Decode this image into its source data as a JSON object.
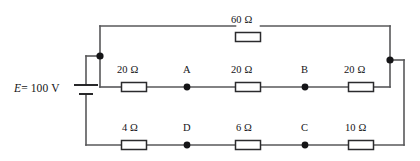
{
  "figure": {
    "kind": "circuit-diagram",
    "width": 420,
    "height": 161,
    "background_color": "#ffffff",
    "wire_color": "#58585a",
    "resistor_border_color": "#2b2b2d",
    "resistor_fill_color": "#ffffff",
    "node_dot_color": "#151517",
    "text_color": "#141416"
  },
  "source": {
    "label": "E = 100 V",
    "symbol_name": "battery-cell",
    "emf_symbol": "E",
    "equals": "=",
    "value": "100",
    "unit": "V"
  },
  "resistors": [
    {
      "id": "r-top-60",
      "label": "60 Ω",
      "value": 60,
      "unit": "Ω",
      "branch": "top",
      "cx": 248,
      "cy": 37,
      "label_x": 231,
      "label_y": 17
    },
    {
      "id": "r-mid-left-20",
      "label": "20 Ω",
      "value": 20,
      "unit": "Ω",
      "branch": "middle",
      "cx": 134,
      "cy": 87,
      "label_x": 117,
      "label_y": 67
    },
    {
      "id": "r-mid-center-20",
      "label": "20 Ω",
      "value": 20,
      "unit": "Ω",
      "branch": "middle",
      "cx": 248,
      "cy": 87,
      "label_x": 231,
      "label_y": 67
    },
    {
      "id": "r-mid-right-20",
      "label": "20 Ω",
      "value": 20,
      "unit": "Ω",
      "branch": "middle",
      "cx": 361,
      "cy": 87,
      "label_x": 344,
      "label_y": 67
    },
    {
      "id": "r-bot-left-4",
      "label": "4 Ω",
      "value": 4,
      "unit": "Ω",
      "branch": "bottom",
      "cx": 134,
      "cy": 145,
      "label_x": 122,
      "label_y": 125
    },
    {
      "id": "r-bot-center-6",
      "label": "6 Ω",
      "value": 6,
      "unit": "Ω",
      "branch": "bottom",
      "cx": 248,
      "cy": 145,
      "label_x": 236,
      "label_y": 125
    },
    {
      "id": "r-bot-right-10",
      "label": "10 Ω",
      "value": 10,
      "unit": "Ω",
      "branch": "bottom",
      "cx": 361,
      "cy": 145,
      "label_x": 345,
      "label_y": 125
    }
  ],
  "nodes": [
    {
      "id": "node-A",
      "label": "A",
      "x": 187,
      "y": 87,
      "label_x": 183,
      "label_y": 67,
      "labeled": true
    },
    {
      "id": "node-B",
      "label": "B",
      "x": 305,
      "y": 87,
      "label_x": 301,
      "label_y": 67,
      "labeled": true
    },
    {
      "id": "node-C",
      "label": "C",
      "x": 305,
      "y": 145,
      "label_x": 301,
      "label_y": 125,
      "labeled": true
    },
    {
      "id": "node-D",
      "label": "D",
      "x": 187,
      "y": 145,
      "label_x": 183,
      "label_y": 125,
      "labeled": true
    },
    {
      "id": "node-left-junction",
      "label": "",
      "x": 100,
      "y": 56,
      "labeled": false
    },
    {
      "id": "node-right-junction",
      "label": "",
      "x": 390,
      "y": 60,
      "labeled": false
    }
  ],
  "geometry": {
    "top_rail_y": 26,
    "middle_rail_y": 87,
    "bottom_rail_y": 145,
    "left_rail_x": 100,
    "right_rail_x": 390,
    "battery_x": 86,
    "battery_y": 89,
    "resistor_box_w": 25,
    "resistor_box_h": 9,
    "node_dot_r": 3.4
  }
}
